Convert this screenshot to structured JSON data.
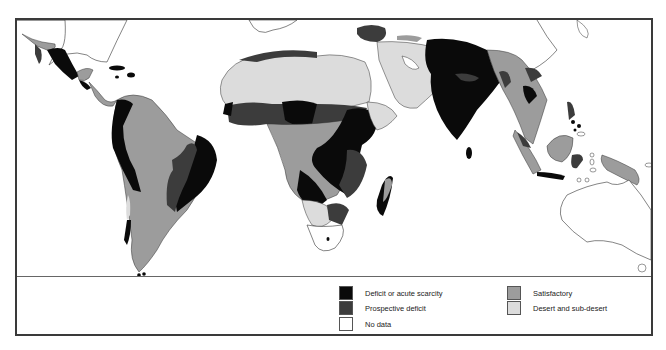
{
  "colors": {
    "deficit": "#0a0a0a",
    "prospective": "#3c3c3c",
    "no_data": "#ffffff",
    "satisfactory": "#9c9c9c",
    "desert": "#dcdcdc",
    "outline": "#333333"
  },
  "legend": {
    "items": [
      {
        "key": "deficit",
        "label": "Deficit or acute scarcity"
      },
      {
        "key": "prospective",
        "label": "Prospective deficit"
      },
      {
        "key": "no_data",
        "label": "No data"
      },
      {
        "key": "satisfactory",
        "label": "Satisfactory"
      },
      {
        "key": "desert",
        "label": "Desert and sub-desert"
      }
    ]
  },
  "map": {
    "regions": [
      "Central America",
      "South America",
      "Africa",
      "Madagascar",
      "Middle East",
      "South Asia",
      "Southeast Asia",
      "Maritime Southeast Asia",
      "New Guinea",
      "Australia"
    ]
  }
}
